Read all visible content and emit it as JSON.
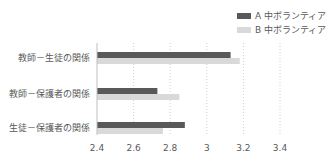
{
  "chart_data": {
    "type": "bar",
    "orientation": "horizontal",
    "title": "",
    "xlabel": "",
    "ylabel": "",
    "categories": [
      "教師－生徒の関係",
      "教師－保護者の関係",
      "生徒－保護者の関係"
    ],
    "series": [
      {
        "name": "A 中ボランティア",
        "color": "#595959",
        "values": [
          3.13,
          2.73,
          2.88
        ]
      },
      {
        "name": "B 中ボランティア",
        "color": "#d9d9d9",
        "values": [
          3.18,
          2.85,
          2.76
        ]
      }
    ],
    "xlim": [
      2.4,
      3.4
    ],
    "xticks": [
      "2.4",
      "2.6",
      "2.8",
      "3",
      "3.2",
      "3.4"
    ],
    "xtick_values": [
      2.4,
      2.6,
      2.8,
      3.0,
      3.2,
      3.4
    ],
    "grid": "vertical-dotted",
    "legend_position": "top-right"
  }
}
